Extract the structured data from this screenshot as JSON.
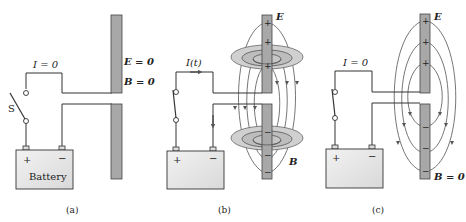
{
  "panels": [
    {
      "id": "a",
      "caption": "(a)",
      "current_label": "I = 0",
      "switch_label": "S",
      "battery_label": "Battery",
      "plus": "+",
      "minus": "−",
      "field_labels": {
        "E": "E = 0",
        "B": "B = 0"
      },
      "switch_state": "open"
    },
    {
      "id": "b",
      "caption": "(b)",
      "current_label": "I(t)",
      "battery_label": "",
      "plus": "+",
      "minus": "−",
      "field_labels": {
        "E": "E",
        "B": "B"
      },
      "switch_state": "closed",
      "plate_top_charges": [
        "+",
        "+",
        "+"
      ],
      "plate_bottom_charges": [
        "−",
        "−",
        "−"
      ]
    },
    {
      "id": "c",
      "caption": "(c)",
      "current_label": "I = 0",
      "battery_label": "",
      "plus": "+",
      "minus": "−",
      "field_labels": {
        "E": "E",
        "B": "B = 0"
      },
      "switch_state": "closed",
      "plate_top_charges": [
        "+",
        "+",
        "+"
      ],
      "plate_bottom_charges": [
        "−",
        "−",
        "−"
      ]
    }
  ],
  "colors": {
    "wire": "#333333",
    "plate_fill": "#a8a8a8",
    "plate_stroke": "#444444",
    "field_line": "#666666",
    "disc_fill": "#cfcfcf",
    "battery_fill": "#e6e6e6"
  }
}
